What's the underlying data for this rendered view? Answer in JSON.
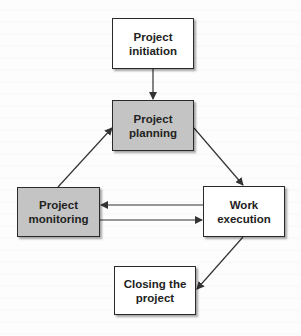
{
  "diagram": {
    "type": "flowchart",
    "colors": {
      "box_highlight_fill": "#c4c4c4",
      "box_default_fill": "#ffffff",
      "border": "#2a2a2a",
      "arrow": "#333333"
    },
    "nodes": [
      {
        "id": "initiation",
        "line1": "Project",
        "line2": "initiation",
        "fill": "white"
      },
      {
        "id": "planning",
        "line1": "Project",
        "line2": "planning",
        "fill": "gray"
      },
      {
        "id": "monitoring",
        "line1": "Project",
        "line2": "monitoring",
        "fill": "gray"
      },
      {
        "id": "execution",
        "line1": "Work",
        "line2": "execution",
        "fill": "white"
      },
      {
        "id": "closing",
        "line1": "Closing the",
        "line2": "project",
        "fill": "white"
      }
    ],
    "edges": [
      {
        "from": "initiation",
        "to": "planning"
      },
      {
        "from": "planning",
        "to": "execution"
      },
      {
        "from": "execution",
        "to": "monitoring"
      },
      {
        "from": "monitoring",
        "to": "execution"
      },
      {
        "from": "monitoring",
        "to": "planning"
      },
      {
        "from": "execution",
        "to": "closing"
      }
    ]
  }
}
